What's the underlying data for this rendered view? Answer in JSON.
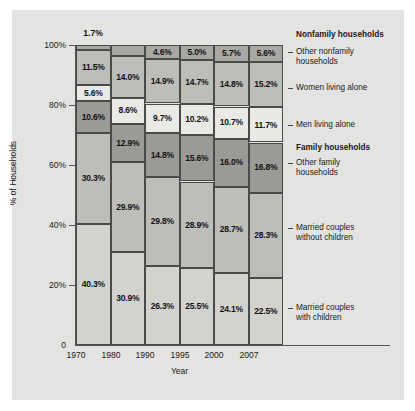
{
  "chart_data": {
    "type": "bar",
    "subtype": "stacked-percentage",
    "title": "",
    "xlabel": "Year",
    "ylabel": "% of Households",
    "categories": [
      "1970",
      "1980",
      "1990",
      "1995",
      "2000",
      "2007"
    ],
    "ylim": [
      0,
      100
    ],
    "ytick_labels": [
      "100%",
      "80%",
      "60%",
      "40%",
      "20%",
      "0"
    ],
    "ytick_values": [
      100,
      80,
      60,
      40,
      20,
      0
    ],
    "grid": false,
    "legend_position": "right",
    "legend_groups": [
      {
        "label": "Nonfamily households",
        "bold": true
      },
      {
        "label": "Family households",
        "bold": true
      }
    ],
    "series": [
      {
        "name": "Other nonfamily households",
        "group": "Nonfamily households",
        "color": "#a8a8a4",
        "values": [
          1.7,
          3.6,
          4.6,
          5.0,
          5.7,
          5.6
        ],
        "labels": [
          "1.7%",
          "3.6%",
          "4.6%",
          "5.0%",
          "5.7%",
          "5.6%"
        ]
      },
      {
        "name": "Women living alone",
        "group": "Nonfamily households",
        "color": "#bdbdb9",
        "values": [
          11.5,
          14.0,
          14.9,
          14.7,
          14.8,
          15.2
        ],
        "labels": [
          "11.5%",
          "14.0%",
          "14.9%",
          "14.7%",
          "14.8%",
          "15.2%"
        ]
      },
      {
        "name": "Men living alone",
        "group": "Nonfamily households",
        "color": "#e9e9e6",
        "values": [
          5.6,
          8.6,
          9.7,
          10.2,
          10.7,
          11.7
        ],
        "labels": [
          "5.6%",
          "8.6%",
          "9.7%",
          "10.2%",
          "10.7%",
          "11.7%"
        ]
      },
      {
        "name": "Other family households",
        "group": "Family households",
        "color": "#9a9a96",
        "values": [
          10.6,
          12.9,
          14.8,
          15.6,
          16.0,
          16.8
        ],
        "labels": [
          "10.6%",
          "12.9%",
          "14.8%",
          "15.6%",
          "16.0%",
          "16.8%"
        ]
      },
      {
        "name": "Married couples without children",
        "group": "Family households",
        "color": "#bdbdb9",
        "values": [
          30.3,
          29.9,
          29.8,
          28.9,
          28.7,
          28.3
        ],
        "labels": [
          "30.3%",
          "29.9%",
          "29.8%",
          "28.9%",
          "28.7%",
          "28.3%"
        ]
      },
      {
        "name": "Married couples with children",
        "group": "Family households",
        "color": "#d2d2ce",
        "values": [
          40.3,
          30.9,
          26.3,
          25.5,
          24.1,
          22.5
        ],
        "labels": [
          "40.3%",
          "30.9%",
          "26.3%",
          "25.5%",
          "24.1%",
          "22.5%"
        ]
      }
    ],
    "annotations": [
      {
        "text": "1.7%",
        "note": "callout above 1970 bar for thin top segment"
      }
    ]
  },
  "axes": {
    "y_title": "% of Households",
    "x_title": "Year"
  },
  "legend": {
    "nonfamily_header": "Nonfamily households",
    "family_header": "Family households",
    "items": [
      {
        "line1": "Other nonfamily",
        "line2": "households"
      },
      {
        "line1": "Women living alone",
        "line2": ""
      },
      {
        "line1": "Men living alone",
        "line2": ""
      },
      {
        "line1": "Other family",
        "line2": "households"
      },
      {
        "line1": "Married couples",
        "line2": "without children"
      },
      {
        "line1": "Married couples",
        "line2": "with children"
      }
    ]
  },
  "callout": {
    "top_1970": "1.7%"
  }
}
